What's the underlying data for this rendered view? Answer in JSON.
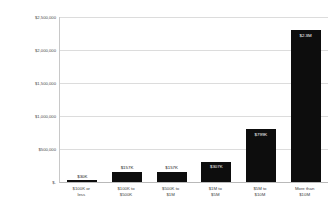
{
  "chart_data": {
    "type": "bar",
    "title": "",
    "xlabel": "",
    "ylabel": "Average budget (indicative) in US$",
    "ylim": [
      0,
      2500000
    ],
    "grid": true,
    "legend": "none",
    "categories": [
      "$100K or less",
      "$100K to $500K",
      "$500K to $1M",
      "$1M to $5M",
      "$5M to $10M",
      "More than $10M"
    ],
    "category_lines": [
      [
        "$100K or",
        "less"
      ],
      [
        "$100K to",
        "$500K"
      ],
      [
        "$500K to",
        "$1M"
      ],
      [
        "$1M to",
        "$5M"
      ],
      [
        "$5M to",
        "$10M"
      ],
      [
        "More than",
        "$10M"
      ]
    ],
    "values": [
      30000,
      157000,
      157000,
      307000,
      799000,
      2300000
    ],
    "data_labels": [
      "$30K",
      "$157K",
      "$157K",
      "$307K",
      "$799K",
      "$2.3M"
    ],
    "label_placement": [
      "outside",
      "outside",
      "outside",
      "inside",
      "inside",
      "inside"
    ],
    "y_ticks": [
      0,
      500000,
      1000000,
      1500000,
      2000000,
      2500000
    ],
    "y_tick_labels": [
      "$-",
      "$500,000",
      "$1,000,000",
      "$1,500,000",
      "$2,000,000",
      "$2,500,000"
    ],
    "bar_color": "#0d0d0d",
    "gridline_color": "#dcdcdc",
    "background_color": "#ffffff"
  }
}
